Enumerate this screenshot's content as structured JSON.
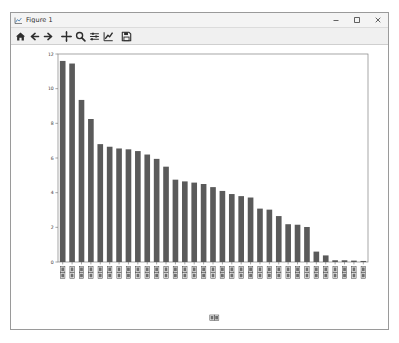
{
  "window": {
    "title": "Figure 1",
    "app_icon": "matplotlib-figure-icon",
    "controls": {
      "minimize_label": "Minimize",
      "maximize_label": "Maximize",
      "close_label": "Close"
    }
  },
  "toolbar": {
    "items": [
      {
        "name": "home-icon",
        "tooltip": "Reset original view"
      },
      {
        "name": "back-arrow-icon",
        "tooltip": "Back to previous view"
      },
      {
        "name": "forward-arrow-icon",
        "tooltip": "Forward to next view"
      },
      {
        "name": "pan-move-icon",
        "tooltip": "Pan axes with left mouse, zoom with right"
      },
      {
        "name": "zoom-magnifier-icon",
        "tooltip": "Zoom to rectangle"
      },
      {
        "name": "configure-subplots-icon",
        "tooltip": "Configure subplots"
      },
      {
        "name": "edit-axis-curve-icon",
        "tooltip": "Edit axis, curve and image parameters"
      },
      {
        "name": "save-disk-icon",
        "tooltip": "Save the figure"
      }
    ]
  },
  "chart_data": {
    "type": "bar",
    "title": "",
    "xlabel": "□□",
    "ylabel": "",
    "xlabel_note": "rotated-missing-glyph-boxes",
    "ylim": [
      0,
      12
    ],
    "yticks": [
      0,
      2,
      4,
      6,
      8,
      10,
      12
    ],
    "ytick_labels": [
      "0",
      "2",
      "4",
      "6",
      "8",
      "10",
      "12"
    ],
    "grid": false,
    "legend": null,
    "bar_color": "#5a5a5a",
    "xtick_rotation": 90,
    "xtick_glyph_note": "CJK labels render as missing-glyph tofu boxes",
    "categories": [
      "□",
      "□",
      "□",
      "□",
      "□",
      "□",
      "□",
      "□",
      "□",
      "□",
      "□",
      "□",
      "□",
      "□",
      "□",
      "□",
      "□",
      "□",
      "□",
      "□",
      "□",
      "□",
      "□",
      "□",
      "□",
      "□",
      "□",
      "□",
      "□",
      "□",
      "□",
      "□",
      "□"
    ],
    "values": [
      11.6,
      11.45,
      9.35,
      8.25,
      6.8,
      6.65,
      6.55,
      6.5,
      6.4,
      6.2,
      5.95,
      5.5,
      4.75,
      4.65,
      4.58,
      4.5,
      4.32,
      4.1,
      3.92,
      3.8,
      3.72,
      3.08,
      3.02,
      2.65,
      2.18,
      2.15,
      2.02,
      0.6,
      0.38,
      0.1,
      0.1,
      0.08,
      0.06
    ]
  }
}
